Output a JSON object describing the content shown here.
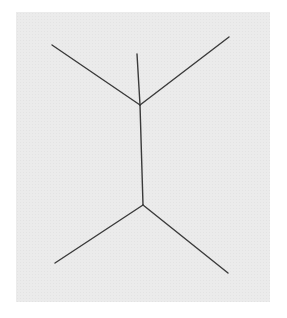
{
  "figure": {
    "type": "line-figure",
    "colors": {
      "background": "#ebebeb",
      "line": "#3a3a3a"
    },
    "segments": [
      {
        "name": "shaft",
        "x1": 137,
        "y1": 54,
        "x2": 140,
        "y2": 105
      },
      {
        "name": "shaft-main",
        "x1": 140,
        "y1": 105,
        "x2": 143,
        "y2": 205
      },
      {
        "name": "top-left-fin",
        "x1": 52,
        "y1": 45,
        "x2": 140,
        "y2": 105
      },
      {
        "name": "top-right-fin",
        "x1": 229,
        "y1": 37,
        "x2": 140,
        "y2": 105
      },
      {
        "name": "bottom-left-fin",
        "x1": 55,
        "y1": 263,
        "x2": 143,
        "y2": 205
      },
      {
        "name": "bottom-right-fin",
        "x1": 228,
        "y1": 273,
        "x2": 143,
        "y2": 205
      }
    ]
  }
}
